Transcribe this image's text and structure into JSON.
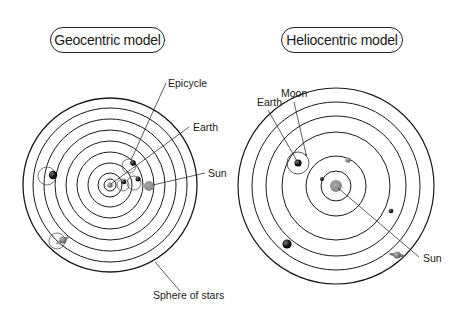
{
  "geocentric": {
    "title": "Geocentric model",
    "labels": {
      "epicycle": "Epicycle",
      "earth": "Earth",
      "sun": "Sun",
      "sphere_of_stars": "Sphere of stars"
    }
  },
  "heliocentric": {
    "title": "Heliocentric model",
    "labels": {
      "moon": "Moon",
      "earth": "Earth",
      "sun": "Sun"
    }
  },
  "colors": {
    "line": "#1a1a1a",
    "planet_dark": "#111111",
    "planet_grey": "#777777",
    "sun_grey": "#8a8a8a",
    "epicycle": "#555555"
  }
}
